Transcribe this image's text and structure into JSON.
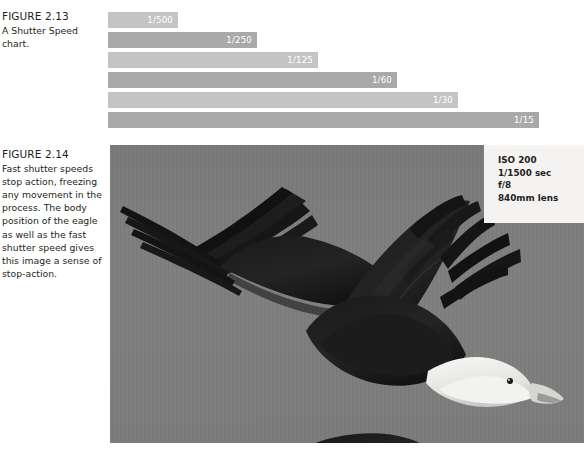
{
  "figure_2_13": {
    "title": "FIGURE 2.13",
    "description": "A Shutter Speed chart."
  },
  "figure_2_14": {
    "title": "FIGURE 2.14",
    "description": "Fast shutter speeds stop action, freezing any movement in the process. The body position of the eagle as well as the fast shutter speed gives this image a sense of stop-action."
  },
  "chart_data": {
    "type": "bar",
    "title": "A Shutter Speed chart.",
    "orientation": "horizontal",
    "categories": [
      "1/500",
      "1/250",
      "1/125",
      "1/60",
      "1/30",
      "1/15"
    ],
    "values": [
      70,
      149,
      210,
      289,
      350,
      431
    ],
    "value_unit": "px",
    "labels": [
      "1/500",
      "1/250",
      "1/125",
      "1/60",
      "1/30",
      "1/15"
    ],
    "bar_colors": [
      "#c4c4c4",
      "#a9a9a9",
      "#c4c4c4",
      "#a9a9a9",
      "#c4c4c4",
      "#a9a9a9"
    ],
    "label_color": "#ffffff",
    "xlabel": "",
    "ylabel": "",
    "grid": false,
    "legend": false,
    "xlim": [
      0,
      431
    ]
  },
  "photo": {
    "alt_description": "Bald eagle in flight against a gray sky, wings spread",
    "sky_color": "#7d7d7d",
    "exif": {
      "iso": "ISO 200",
      "shutter": "1/1500 sec",
      "aperture": "f/8",
      "lens": "840mm lens"
    }
  }
}
